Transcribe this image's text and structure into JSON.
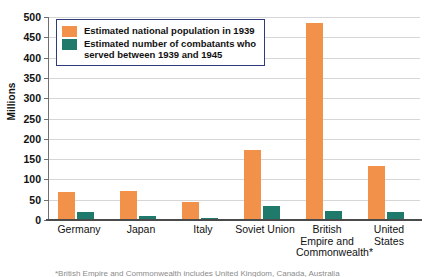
{
  "chart_data": {
    "type": "bar",
    "title": "",
    "xlabel": "",
    "ylabel": "Millions",
    "ylim": [
      0,
      500
    ],
    "yticks": [
      0,
      50,
      100,
      150,
      200,
      250,
      300,
      350,
      400,
      450,
      500
    ],
    "grid": true,
    "legend_position": "top-left",
    "categories": [
      "Germany",
      "Japan",
      "Italy",
      "Soviet Union",
      "British\nEmpire and\nCommonwealth*",
      "United States"
    ],
    "series": [
      {
        "name": "Estimated national population in 1939",
        "color": "#f2914a",
        "values": [
          69,
          71,
          45,
          172,
          485,
          133
        ]
      },
      {
        "name": "Estimated number of combatants who\nserved between 1939 and 1945",
        "color": "#1f7a6b",
        "values": [
          20,
          9,
          4,
          35,
          22,
          20
        ]
      }
    ]
  },
  "axis": {
    "y_title": "Millions"
  },
  "legend": {
    "items": [
      {
        "label": "Estimated national population in 1939",
        "color": "#f2914a"
      },
      {
        "label": "Estimated number of combatants who\nserved between 1939 and 1945",
        "color": "#1f7a6b"
      }
    ]
  },
  "footnote": {
    "text": "*British Empire and Commonwealth includes United Kingdom, Canada, Australia"
  },
  "colors": {
    "population": "#f2914a",
    "combatants": "#1f7a6b",
    "legend_border": "#2f3b78",
    "gridline": "#d6d6d6",
    "axis": "#6e6e6e",
    "background": "#ffffff"
  }
}
